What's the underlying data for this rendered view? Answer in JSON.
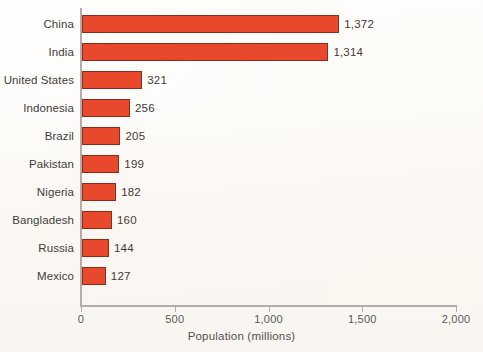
{
  "chart_data": {
    "type": "bar",
    "orientation": "horizontal",
    "title": "",
    "xlabel": "Population (millions)",
    "ylabel": "",
    "xlim": [
      0,
      2000
    ],
    "xticks": [
      "0",
      "500",
      "1,000",
      "1,500",
      "2,000"
    ],
    "xtick_values": [
      0,
      500,
      1000,
      1500,
      2000
    ],
    "grid": false,
    "legend": "none",
    "bar_color": "#e8482c",
    "bar_edge_color": "#8a2d1b",
    "axis_color": "#b4aeaa",
    "text_color": "#413d3a",
    "background_color": "#fdfbf8",
    "categories": [
      "China",
      "India",
      "United States",
      "Indonesia",
      "Brazil",
      "Pakistan",
      "Nigeria",
      "Bangladesh",
      "Russia",
      "Mexico"
    ],
    "values": [
      1372,
      1314,
      321,
      256,
      205,
      199,
      182,
      160,
      144,
      127
    ],
    "value_labels": [
      "1,372",
      "1,314",
      "321",
      "256",
      "205",
      "199",
      "182",
      "160",
      "144",
      "127"
    ]
  }
}
